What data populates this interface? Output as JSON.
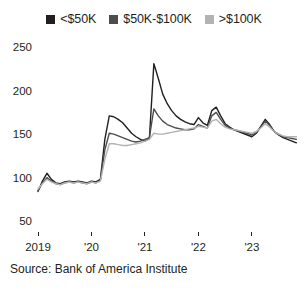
{
  "legend": {
    "position": "top",
    "entries": [
      {
        "label": "<$50K",
        "swatch_name": "legend-swatch-under-50k",
        "color": "#231f20"
      },
      {
        "label": "$50K-$100K",
        "swatch_name": "legend-swatch-50k-100k",
        "color": "#4d4d4d"
      },
      {
        "label": ">$100K",
        "swatch_name": "legend-swatch-over-100k",
        "color": "#b3b3b3"
      }
    ]
  },
  "source": "Source: Bank of America Institute",
  "chart_data": {
    "type": "line",
    "title": "",
    "subtitle": "",
    "xlabel": "",
    "ylabel": "",
    "grid": false,
    "legend_position": "top",
    "ylim": [
      50,
      250
    ],
    "yticks": [
      50,
      100,
      150,
      200,
      250
    ],
    "ytick_labels": [
      "50",
      "100",
      "150",
      "200",
      "250"
    ],
    "xlim": [
      2019.0,
      2023.9
    ],
    "xticks": [
      2019,
      2020,
      2021,
      2022,
      2023
    ],
    "xtick_labels": [
      "2019",
      "'20",
      "'21",
      "'22",
      "'23"
    ],
    "x": [
      2019.0,
      2019.083,
      2019.167,
      2019.25,
      2019.333,
      2019.417,
      2019.5,
      2019.583,
      2019.667,
      2019.75,
      2019.833,
      2019.917,
      2020.0,
      2020.083,
      2020.167,
      2020.25,
      2020.333,
      2020.417,
      2020.5,
      2020.583,
      2020.667,
      2020.75,
      2020.833,
      2020.917,
      2021.0,
      2021.083,
      2021.167,
      2021.25,
      2021.333,
      2021.417,
      2021.5,
      2021.583,
      2021.667,
      2021.75,
      2021.833,
      2021.917,
      2022.0,
      2022.083,
      2022.167,
      2022.25,
      2022.333,
      2022.417,
      2022.5,
      2022.583,
      2022.667,
      2022.75,
      2022.833,
      2022.917,
      2023.0,
      2023.083,
      2023.167,
      2023.25,
      2023.333,
      2023.417,
      2023.5,
      2023.583,
      2023.667,
      2023.75,
      2023.833
    ],
    "series": [
      {
        "name": "<$50K",
        "color": "#231f20",
        "values": [
          85,
          97,
          106,
          99,
          95,
          94,
          96,
          97,
          96,
          97,
          96,
          95,
          97,
          96,
          99,
          145,
          172,
          171,
          168,
          164,
          158,
          152,
          148,
          145,
          143,
          146,
          232,
          215,
          197,
          186,
          178,
          172,
          168,
          165,
          163,
          162,
          170,
          164,
          161,
          178,
          182,
          172,
          163,
          159,
          156,
          154,
          152,
          150,
          148,
          152,
          160,
          168,
          162,
          154,
          150,
          147,
          145,
          143,
          141
        ]
      },
      {
        "name": "$50K-$100K",
        "color": "#4d4d4d",
        "values": [
          86,
          95,
          101,
          97,
          94,
          93,
          95,
          96,
          95,
          96,
          95,
          94,
          96,
          95,
          98,
          133,
          152,
          151,
          149,
          147,
          145,
          143,
          142,
          143,
          145,
          147,
          180,
          172,
          166,
          162,
          160,
          158,
          157,
          156,
          156,
          157,
          162,
          160,
          158,
          172,
          176,
          168,
          161,
          158,
          156,
          155,
          153,
          152,
          150,
          153,
          159,
          166,
          161,
          154,
          151,
          148,
          147,
          146,
          145
        ]
      },
      {
        "name": ">$100K",
        "color": "#b3b3b3",
        "values": [
          88,
          94,
          99,
          96,
          94,
          93,
          95,
          96,
          95,
          96,
          95,
          94,
          96,
          95,
          97,
          122,
          140,
          140,
          139,
          138,
          138,
          139,
          140,
          141,
          143,
          145,
          152,
          151,
          151,
          152,
          153,
          154,
          155,
          156,
          157,
          158,
          160,
          159,
          158,
          166,
          168,
          163,
          159,
          157,
          156,
          155,
          154,
          153,
          152,
          154,
          158,
          163,
          159,
          154,
          151,
          149,
          148,
          148,
          148
        ]
      }
    ]
  }
}
